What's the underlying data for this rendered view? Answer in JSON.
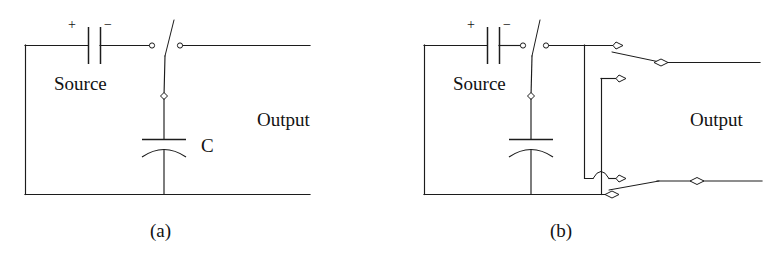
{
  "figure": {
    "background_color": "#ffffff",
    "line_color": "#1c1c1c",
    "width": 773,
    "height": 257
  },
  "panels": [
    {
      "id": "a",
      "caption": "(a)",
      "labels": {
        "source": "Source",
        "output": "Output",
        "capacitor": "C",
        "plus": "+",
        "minus": "−"
      },
      "components": [
        "battery-source",
        "spdt-switch",
        "capacitor-c",
        "output-line"
      ]
    },
    {
      "id": "b",
      "caption": "(b)",
      "labels": {
        "source": "Source",
        "output": "Output",
        "plus": "+",
        "minus": "−"
      },
      "components": [
        "battery-source",
        "spdt-switch",
        "capacitor",
        "upper-output-switch",
        "lower-output-switch",
        "wire-crossover-hop",
        "output-line"
      ]
    }
  ]
}
